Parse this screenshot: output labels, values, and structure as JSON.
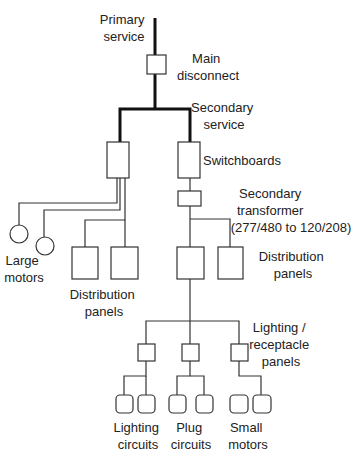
{
  "diagram": {
    "type": "electrical distribution hierarchy",
    "labels": {
      "primary_service": [
        "Primary",
        "service"
      ],
      "main_disconnect": [
        "Main",
        "disconnect"
      ],
      "secondary_service": [
        "Secondary",
        "service"
      ],
      "switchboards": [
        "Switchboards"
      ],
      "secondary_transformer": [
        "Secondary",
        "transformer",
        "(277/480 to 120/208)"
      ],
      "distribution_panels_right": [
        "Distribution",
        "panels"
      ],
      "large_motors": [
        "Large",
        "motors"
      ],
      "distribution_panels_left": [
        "Distribution",
        "panels"
      ],
      "lighting_receptacle_panels": [
        "Lighting /",
        "receptacle",
        "panels"
      ],
      "lighting_circuits": [
        "Lighting",
        "circuits"
      ],
      "plug_circuits": [
        "Plug",
        "circuits"
      ],
      "small_motors": [
        "Small",
        "motors"
      ]
    }
  }
}
